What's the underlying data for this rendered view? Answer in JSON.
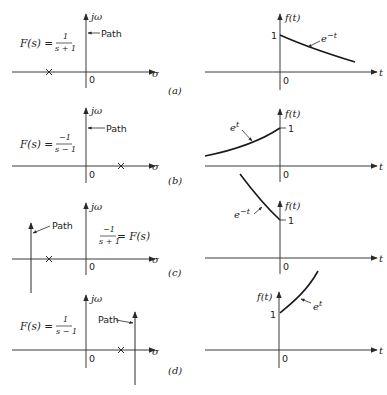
{
  "figure": {
    "panels": [
      {
        "label": "(a)",
        "splane": {
          "function_lhs": "F(s) =",
          "numerator": "1",
          "denominator": "s + 1",
          "imag_axis_label": "jω",
          "real_axis_label": "σ",
          "origin_label": "0",
          "path_label": "Path",
          "pole_at": -1,
          "path_re": 0
        },
        "time": {
          "y_label": "f(t)",
          "x_label": "t",
          "origin_label": "0",
          "one_label": "1",
          "curve_label": "e^{-t}",
          "curve_label_base": "e",
          "curve_label_exp": "−t"
        }
      },
      {
        "label": "(b)",
        "splane": {
          "function_lhs": "F(s) =",
          "numerator": "−1",
          "denominator": "s − 1",
          "imag_axis_label": "jω",
          "real_axis_label": "σ",
          "origin_label": "0",
          "path_label": "Path",
          "pole_at": 1,
          "path_re": 0
        },
        "time": {
          "y_label": "f(t)",
          "x_label": "t",
          "origin_label": "0",
          "one_label": "1",
          "curve_label_base": "e",
          "curve_label_exp": "t"
        }
      },
      {
        "label": "(c)",
        "splane": {
          "function_rhs": "= F(s)",
          "numerator": "−1",
          "denominator": "s + 1",
          "imag_axis_label": "jω",
          "real_axis_label": "σ",
          "origin_label": "0",
          "path_label": "Path",
          "pole_at": -1,
          "path_re": -2
        },
        "time": {
          "y_label": "f(t)",
          "x_label": "t",
          "origin_label": "0",
          "one_label": "1",
          "curve_label_base": "e",
          "curve_label_exp": "−t"
        }
      },
      {
        "label": "(d)",
        "splane": {
          "function_lhs": "F(s) =",
          "numerator": "1",
          "denominator": "s − 1",
          "imag_axis_label": "jω",
          "real_axis_label": "σ",
          "origin_label": "0",
          "path_label": "Path",
          "pole_at": 1,
          "path_re": 1.5
        },
        "time": {
          "y_label": "f(t)",
          "x_label": "t",
          "origin_label": "0",
          "one_label": "1",
          "curve_label_base": "e",
          "curve_label_exp": "t"
        }
      }
    ]
  }
}
